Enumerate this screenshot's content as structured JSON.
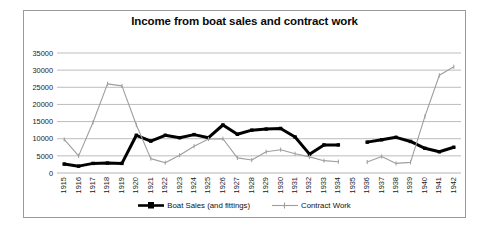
{
  "chart_data": {
    "type": "line",
    "title": "Income from boat sales and contract work",
    "xlabel": "",
    "ylabel": "",
    "ylim": [
      0,
      35000
    ],
    "ytick_step": 5000,
    "yticks": [
      "0",
      "5000",
      "10000",
      "15000",
      "20000",
      "25000",
      "30000",
      "35000"
    ],
    "grid": true,
    "legend_position": "bottom",
    "categories": [
      "1915",
      "1916",
      "1917",
      "1918",
      "1919",
      "1920",
      "1921",
      "1922",
      "1923",
      "1924",
      "1925",
      "1926",
      "1927",
      "1928",
      "1929",
      "1930",
      "1931",
      "1932",
      "1933",
      "1934",
      "1935",
      "1936",
      "1937",
      "1938",
      "1939",
      "1940",
      "1941",
      "1942"
    ],
    "series": [
      {
        "name": "Boat Sales (and fittings)",
        "color": "#000000",
        "values": [
          2600,
          2000,
          2800,
          2900,
          2800,
          11000,
          9300,
          11000,
          10300,
          11200,
          10300,
          14000,
          11300,
          12500,
          12800,
          13000,
          10500,
          5500,
          8200,
          8200,
          null,
          9000,
          9700,
          10400,
          9200,
          7200,
          6200,
          7500
        ]
      },
      {
        "name": "Contract Work",
        "color": "#9e9e9e",
        "values": [
          9800,
          5000,
          14800,
          26000,
          25400,
          14000,
          4200,
          3000,
          5200,
          7800,
          9900,
          10000,
          4400,
          3800,
          6200,
          6800,
          5600,
          4700,
          3600,
          3300,
          null,
          3200,
          4800,
          2800,
          3100,
          16500,
          28500,
          31000
        ]
      }
    ]
  },
  "legend": {
    "items": [
      {
        "label": "Boat Sales (and fittings)",
        "color": "#000000",
        "width": 3.2,
        "marker": "square"
      },
      {
        "label": "Contract Work",
        "color": "#9e9e9e",
        "width": 1.1,
        "marker": "tick"
      }
    ]
  }
}
